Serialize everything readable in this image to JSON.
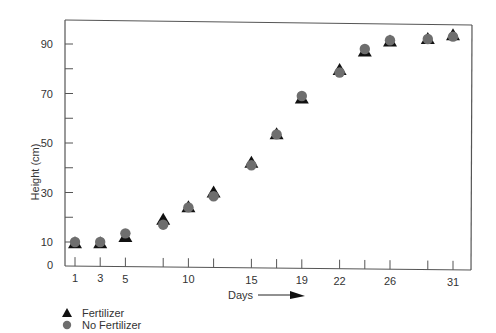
{
  "chart_data": {
    "type": "scatter",
    "title": "",
    "xlabel": "Days",
    "ylabel": "Height (cm)",
    "x_ticks": [
      1,
      3,
      5,
      8,
      10,
      12,
      15,
      17,
      19,
      22,
      24,
      26,
      29,
      31
    ],
    "x_tick_labels": {
      "1": "1",
      "3": "3",
      "5": "5",
      "10": "10",
      "15": "15",
      "19": "19",
      "22": "22",
      "26": "26",
      "31": "31"
    },
    "y_ticks": [
      0,
      10,
      20,
      30,
      40,
      50,
      60,
      70,
      80,
      90
    ],
    "y_tick_labels": {
      "0": "0",
      "10": "10",
      "30": "30",
      "50": "50",
      "70": "70",
      "90": "90"
    },
    "xlim": [
      0,
      32
    ],
    "ylim": [
      0,
      100
    ],
    "grid": false,
    "legend_position": "bottom-left",
    "x": [
      1,
      3,
      5,
      8,
      10,
      12,
      15,
      17,
      19,
      22,
      24,
      26,
      29,
      31
    ],
    "series": [
      {
        "name": "Fertilizer",
        "marker": "triangle",
        "color": "#111111",
        "values": [
          9.5,
          9.5,
          12,
          19,
          24,
          30,
          42,
          53.5,
          68,
          79.5,
          87,
          91,
          92,
          93.5
        ]
      },
      {
        "name": "No Fertilizer",
        "marker": "circle",
        "color": "#6e6e6e",
        "values": [
          10,
          10,
          13.5,
          17,
          24,
          28.5,
          41,
          53.5,
          69,
          78.5,
          88,
          91.5,
          92,
          93
        ]
      }
    ]
  },
  "legend": {
    "items": [
      {
        "label": "Fertilizer",
        "marker": "triangle"
      },
      {
        "label": "No Fertilizer",
        "marker": "circle"
      }
    ]
  },
  "axes": {
    "x_title": "Days",
    "y_title": "Height (cm)"
  }
}
